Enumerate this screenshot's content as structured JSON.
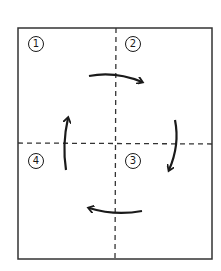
{
  "diagram": {
    "quadrants": [
      {
        "id": 1,
        "label": "1",
        "position": "top-left"
      },
      {
        "id": 2,
        "label": "2",
        "position": "top-right"
      },
      {
        "id": 3,
        "label": "3",
        "position": "bottom-right"
      },
      {
        "id": 4,
        "label": "4",
        "position": "bottom-left"
      }
    ],
    "arrows": [
      {
        "from": "1",
        "to": "2",
        "direction": "right"
      },
      {
        "from": "2",
        "to": "3",
        "direction": "down"
      },
      {
        "from": "3",
        "to": "4",
        "direction": "left"
      },
      {
        "from": "4",
        "to": "1",
        "direction": "up"
      }
    ],
    "rotation": "clockwise",
    "colors": {
      "stroke": "#1a1a1a",
      "background": "#ffffff"
    }
  }
}
